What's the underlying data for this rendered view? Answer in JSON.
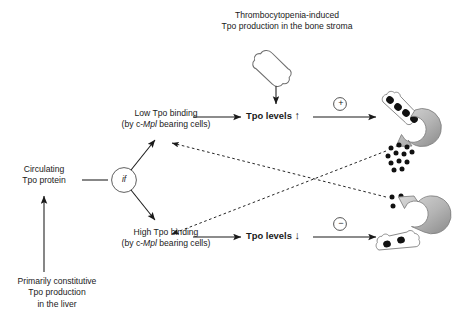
{
  "diagram": {
    "title_line1": "Thrombocytopenia-induced",
    "title_line2": "Tpo production in the bone stroma",
    "low_binding_line1": "Low Tpo binding",
    "low_binding_pre": "(by c-",
    "low_binding_italic": "Mpl",
    "low_binding_post": " bearing cells)",
    "high_binding_line1": "High Tpo binding",
    "high_binding_pre": "(by c-",
    "high_binding_italic": "Mpl",
    "high_binding_post": " bearing cells)",
    "circulating_line1": "Circulating",
    "circulating_line2": "Tpo protein",
    "liver_line1": "Primarily constitutive",
    "liver_line2": "Tpo production",
    "liver_line3": "in the liver",
    "if_node_label": "if",
    "tpo_levels_up_text": "Tpo levels",
    "tpo_levels_up_arrow": "↑",
    "tpo_levels_down_text": "Tpo levels",
    "tpo_levels_down_arrow": "↓",
    "plus_sign": "+",
    "minus_sign": "−"
  },
  "icons": {
    "bone_stroma": "bone-icon",
    "megakaryocyte_bone_high": "bone-with-megakaryocytes-icon",
    "megakaryocyte_bone_low": "bone-with-megakaryocytes-icon",
    "platelets_many": "platelet-cluster-icon",
    "platelets_few": "platelet-cluster-icon",
    "cycle_arrow_top": "circular-arrow-icon",
    "cycle_arrow_bottom": "circular-arrow-icon"
  },
  "counts": {
    "megakaryocytes_high": 4,
    "megakaryocytes_low": 2,
    "platelets_many": 12,
    "platelets_few": 3
  },
  "colors": {
    "stroke": "#1a1a1a",
    "bone_outline": "#7a7a7a",
    "cycle_arrow_light": "#cfcfcf",
    "cycle_arrow_dark": "#8c8c8c",
    "platelet": "#111111",
    "background": "#ffffff"
  }
}
